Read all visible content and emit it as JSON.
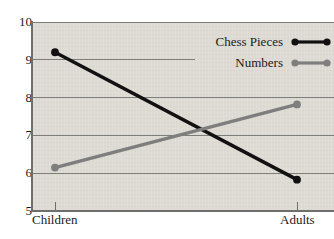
{
  "chart_data": {
    "type": "line",
    "title": "",
    "xlabel": "",
    "ylabel": "",
    "categories": [
      "Children",
      "Adults"
    ],
    "ylim": [
      5,
      10
    ],
    "yticks": [
      5,
      6,
      7,
      8,
      9,
      10
    ],
    "grid": true,
    "legend_position": "top-right",
    "series": [
      {
        "name": "Chess Pieces",
        "color": "#111111",
        "values": [
          9.2,
          5.83
        ]
      },
      {
        "name": "Numbers",
        "color": "#7e7e7e",
        "values": [
          6.15,
          7.82
        ]
      }
    ]
  },
  "axis": {
    "y_labels": [
      "10",
      "9",
      "8",
      "7",
      "6",
      "5"
    ],
    "x_labels": [
      "Children",
      "Adults"
    ]
  },
  "legend": {
    "items": [
      {
        "label": "Chess Pieces",
        "marker": "line-with-dots-icon",
        "color": "#111111"
      },
      {
        "label": "Numbers",
        "marker": "line-with-dots-icon",
        "color": "#7e7e7e"
      }
    ]
  },
  "colors": {
    "plot_background": "#dedbd4",
    "gridline": "#7d7d79",
    "axis": "#6e6e6a",
    "text": "#1a1a1a",
    "series_chess_pieces": "#111111",
    "series_numbers": "#7e7e7e"
  }
}
